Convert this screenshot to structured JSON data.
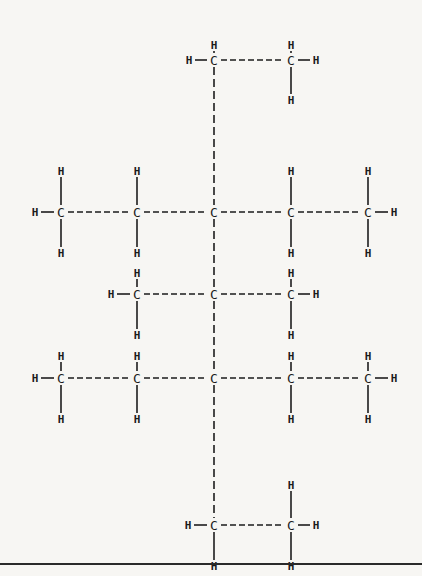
{
  "diagram": {
    "title": "",
    "type": "structural-formula",
    "colors": {
      "background": "#f7f6f3",
      "ink": "#1d1d1d"
    },
    "atoms": [
      {
        "id": "c1",
        "el": "C",
        "x": 214,
        "y": 60
      },
      {
        "id": "c2",
        "el": "C",
        "x": 291,
        "y": 60
      },
      {
        "id": "c3",
        "el": "C",
        "x": 61,
        "y": 212
      },
      {
        "id": "c4",
        "el": "C",
        "x": 137,
        "y": 212
      },
      {
        "id": "c5",
        "el": "C",
        "x": 214,
        "y": 212
      },
      {
        "id": "c6",
        "el": "C",
        "x": 291,
        "y": 212
      },
      {
        "id": "c7",
        "el": "C",
        "x": 368,
        "y": 212
      },
      {
        "id": "c8",
        "el": "C",
        "x": 137,
        "y": 294
      },
      {
        "id": "c9",
        "el": "C",
        "x": 214,
        "y": 294
      },
      {
        "id": "c10",
        "el": "C",
        "x": 291,
        "y": 294
      },
      {
        "id": "c11",
        "el": "C",
        "x": 61,
        "y": 378
      },
      {
        "id": "c12",
        "el": "C",
        "x": 137,
        "y": 378
      },
      {
        "id": "c13",
        "el": "C",
        "x": 214,
        "y": 378
      },
      {
        "id": "c14",
        "el": "C",
        "x": 291,
        "y": 378
      },
      {
        "id": "c15",
        "el": "C",
        "x": 368,
        "y": 378
      },
      {
        "id": "c16",
        "el": "C",
        "x": 214,
        "y": 525
      },
      {
        "id": "c17",
        "el": "C",
        "x": 291,
        "y": 525
      },
      {
        "id": "h1",
        "el": "H",
        "x": 214,
        "y": 45
      },
      {
        "id": "h2",
        "el": "H",
        "x": 189,
        "y": 60
      },
      {
        "id": "h3",
        "el": "H",
        "x": 291,
        "y": 45
      },
      {
        "id": "h4",
        "el": "H",
        "x": 316,
        "y": 60
      },
      {
        "id": "h5",
        "el": "H",
        "x": 291,
        "y": 100
      },
      {
        "id": "h6",
        "el": "H",
        "x": 61,
        "y": 171
      },
      {
        "id": "h7",
        "el": "H",
        "x": 35,
        "y": 212
      },
      {
        "id": "h8",
        "el": "H",
        "x": 61,
        "y": 253
      },
      {
        "id": "h9",
        "el": "H",
        "x": 137,
        "y": 171
      },
      {
        "id": "h10",
        "el": "H",
        "x": 137,
        "y": 253
      },
      {
        "id": "h11",
        "el": "H",
        "x": 291,
        "y": 171
      },
      {
        "id": "h12",
        "el": "H",
        "x": 291,
        "y": 253
      },
      {
        "id": "h13",
        "el": "H",
        "x": 368,
        "y": 171
      },
      {
        "id": "h14",
        "el": "H",
        "x": 394,
        "y": 212
      },
      {
        "id": "h15",
        "el": "H",
        "x": 368,
        "y": 253
      },
      {
        "id": "h16",
        "el": "H",
        "x": 137,
        "y": 273
      },
      {
        "id": "h17",
        "el": "H",
        "x": 111,
        "y": 294
      },
      {
        "id": "h18",
        "el": "H",
        "x": 137,
        "y": 335
      },
      {
        "id": "h19",
        "el": "H",
        "x": 291,
        "y": 273
      },
      {
        "id": "h20",
        "el": "H",
        "x": 316,
        "y": 294
      },
      {
        "id": "h21",
        "el": "H",
        "x": 291,
        "y": 335
      },
      {
        "id": "h22",
        "el": "H",
        "x": 137,
        "y": 356
      },
      {
        "id": "h23",
        "el": "H",
        "x": 291,
        "y": 356
      },
      {
        "id": "h24",
        "el": "H",
        "x": 61,
        "y": 356
      },
      {
        "id": "h25",
        "el": "H",
        "x": 35,
        "y": 378
      },
      {
        "id": "h26",
        "el": "H",
        "x": 61,
        "y": 419
      },
      {
        "id": "h27",
        "el": "H",
        "x": 137,
        "y": 419
      },
      {
        "id": "h28",
        "el": "H",
        "x": 291,
        "y": 419
      },
      {
        "id": "h29",
        "el": "H",
        "x": 368,
        "y": 356
      },
      {
        "id": "h30",
        "el": "H",
        "x": 394,
        "y": 378
      },
      {
        "id": "h31",
        "el": "H",
        "x": 368,
        "y": 419
      },
      {
        "id": "h32",
        "el": "H",
        "x": 291,
        "y": 485
      },
      {
        "id": "h33",
        "el": "H",
        "x": 188,
        "y": 525
      },
      {
        "id": "h34",
        "el": "H",
        "x": 316,
        "y": 525
      },
      {
        "id": "h35",
        "el": "H",
        "x": 214,
        "y": 566
      },
      {
        "id": "h36",
        "el": "H",
        "x": 291,
        "y": 566
      }
    ],
    "bonds": [
      {
        "a": "c1",
        "b": "c2",
        "style": "dashed"
      },
      {
        "a": "c1",
        "b": "c5",
        "style": "dashed"
      },
      {
        "a": "c3",
        "b": "c4",
        "style": "dashed"
      },
      {
        "a": "c4",
        "b": "c5",
        "style": "dashed"
      },
      {
        "a": "c5",
        "b": "c6",
        "style": "dashed"
      },
      {
        "a": "c6",
        "b": "c7",
        "style": "dashed"
      },
      {
        "a": "c5",
        "b": "c9",
        "style": "dashed"
      },
      {
        "a": "c8",
        "b": "c9",
        "style": "dashed"
      },
      {
        "a": "c9",
        "b": "c10",
        "style": "dashed"
      },
      {
        "a": "c9",
        "b": "c13",
        "style": "dashed"
      },
      {
        "a": "c11",
        "b": "c12",
        "style": "dashed"
      },
      {
        "a": "c12",
        "b": "c13",
        "style": "dashed"
      },
      {
        "a": "c13",
        "b": "c14",
        "style": "dashed"
      },
      {
        "a": "c14",
        "b": "c15",
        "style": "dashed"
      },
      {
        "a": "c13",
        "b": "c16",
        "style": "dashed"
      },
      {
        "a": "c16",
        "b": "c17",
        "style": "dashed"
      },
      {
        "a": "c1",
        "b": "h1"
      },
      {
        "a": "c1",
        "b": "h2"
      },
      {
        "a": "c2",
        "b": "h3"
      },
      {
        "a": "c2",
        "b": "h4"
      },
      {
        "a": "c2",
        "b": "h5"
      },
      {
        "a": "c3",
        "b": "h6"
      },
      {
        "a": "c3",
        "b": "h7"
      },
      {
        "a": "c3",
        "b": "h8"
      },
      {
        "a": "c4",
        "b": "h9"
      },
      {
        "a": "c4",
        "b": "h10"
      },
      {
        "a": "c6",
        "b": "h11"
      },
      {
        "a": "c6",
        "b": "h12"
      },
      {
        "a": "c7",
        "b": "h13"
      },
      {
        "a": "c7",
        "b": "h14"
      },
      {
        "a": "c7",
        "b": "h15"
      },
      {
        "a": "c8",
        "b": "h16"
      },
      {
        "a": "c8",
        "b": "h17"
      },
      {
        "a": "c8",
        "b": "h18"
      },
      {
        "a": "c10",
        "b": "h19"
      },
      {
        "a": "c10",
        "b": "h20"
      },
      {
        "a": "c10",
        "b": "h21"
      },
      {
        "a": "c11",
        "b": "h24"
      },
      {
        "a": "c11",
        "b": "h25"
      },
      {
        "a": "c11",
        "b": "h26"
      },
      {
        "a": "c12",
        "b": "h22"
      },
      {
        "a": "c12",
        "b": "h27"
      },
      {
        "a": "c14",
        "b": "h23"
      },
      {
        "a": "c14",
        "b": "h28"
      },
      {
        "a": "c15",
        "b": "h29"
      },
      {
        "a": "c15",
        "b": "h30"
      },
      {
        "a": "c15",
        "b": "h31"
      },
      {
        "a": "c16",
        "b": "h33"
      },
      {
        "a": "c16",
        "b": "h35"
      },
      {
        "a": "c17",
        "b": "h32"
      },
      {
        "a": "c17",
        "b": "h34"
      },
      {
        "a": "c17",
        "b": "h36"
      }
    ]
  }
}
